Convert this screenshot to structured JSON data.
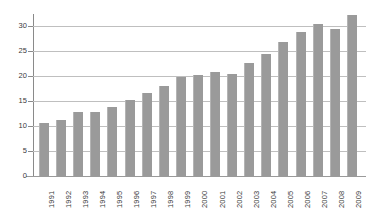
{
  "chart_data": {
    "type": "bar",
    "title": "",
    "subtitle": "",
    "xlabel": "",
    "ylabel": "",
    "categories": [
      "1991",
      "1992",
      "1993",
      "1994",
      "1995",
      "1996",
      "1997",
      "1998",
      "1999",
      "2000",
      "2001",
      "2002",
      "2003",
      "2004",
      "2005",
      "2006",
      "2007",
      "2008",
      "2009"
    ],
    "values": [
      10.7,
      11.2,
      12.8,
      12.8,
      13.9,
      15.2,
      16.6,
      18.0,
      19.9,
      20.3,
      20.9,
      20.4,
      22.6,
      24.4,
      26.8,
      28.8,
      30.5,
      29.4,
      32.2
    ],
    "series": [
      {
        "name": "",
        "values": [
          10.7,
          11.2,
          12.8,
          12.8,
          13.9,
          15.2,
          16.6,
          18.0,
          19.9,
          20.3,
          20.9,
          20.4,
          22.6,
          24.4,
          26.8,
          28.8,
          30.5,
          29.4,
          32.2
        ]
      }
    ],
    "ylim": [
      0,
      33
    ],
    "y_ticks": [
      0,
      5,
      10,
      15,
      20,
      25,
      30
    ],
    "y_tick_labels": [
      "0",
      "5",
      "10",
      "15",
      "20",
      "25",
      "30"
    ],
    "gridlines": true,
    "grid_axis": "y",
    "legend": false,
    "legend_position": "none",
    "bar_color": "#9a9a9a",
    "grid_color": "#bfbfbf",
    "axis_color": "#8a8a8a",
    "background_color": "#ffffff",
    "x_tick_label_rotation": -90,
    "annotations": []
  }
}
